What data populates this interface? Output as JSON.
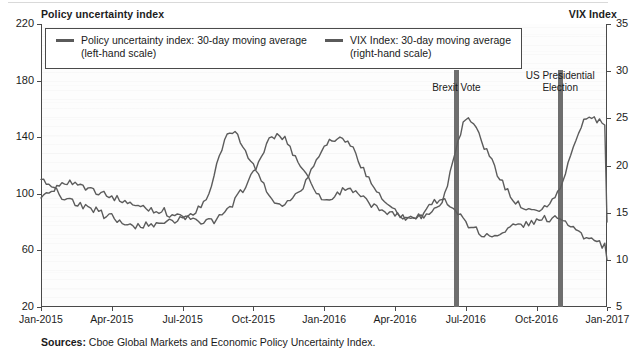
{
  "left_axis_title": "Policy uncertainty index",
  "right_axis_title": "VIX Index",
  "legend": {
    "entries": [
      {
        "label_line1": "Policy uncertainty index: 30-day moving average",
        "label_line2": "(left-hand scale)",
        "color": "#5c5c5c"
      },
      {
        "label_line1": "VIX Index: 30-day moving average",
        "label_line2": "(right-hand scale)",
        "color": "#5c5c5c"
      }
    ]
  },
  "annotations": [
    {
      "name": "brexit-vote",
      "label_line1": "Brexit Vote",
      "label_line2": "",
      "x_value": "Jun-2016"
    },
    {
      "name": "us-presidential-election",
      "label_line1": "US Presidential",
      "label_line2": "Election",
      "x_value": "Nov-2016"
    }
  ],
  "source": {
    "prefix": "Sources:",
    "text": "Cboe Global Markets and Economic Policy Uncertainty Index."
  },
  "chart_data": {
    "type": "line",
    "title": "",
    "xlabel": "",
    "grid": false,
    "legend_position": "top-inside",
    "x_tick_labels": [
      "Jan-2015",
      "Apr-2015",
      "Jul-2015",
      "Oct-2015",
      "Jan-2016",
      "Apr-2016",
      "Jul-2016",
      "Oct-2016",
      "Jan-2017",
      "Apr-2017",
      "Jul-2017",
      "Oct-2017"
    ],
    "x_range": [
      "Jan-2015",
      "Dec-2017"
    ],
    "axes": [
      {
        "id": "left",
        "label": "Policy uncertainty index",
        "ticks": [
          220,
          180,
          140,
          100,
          60,
          20
        ],
        "ylim": [
          20,
          220
        ]
      },
      {
        "id": "right",
        "label": "VIX Index",
        "ticks": [
          35,
          30,
          25,
          20,
          15,
          10,
          5
        ],
        "ylim": [
          5,
          35
        ]
      }
    ],
    "series": [
      {
        "name": "Policy uncertainty index: 30-day moving average",
        "axis": "left",
        "ylabel": "Policy uncertainty index",
        "color": "#5c5c5c",
        "x": [
          "2015-01",
          "2015-02",
          "2015-03",
          "2015-04",
          "2015-05",
          "2015-06",
          "2015-07",
          "2015-08",
          "2015-09",
          "2015-10",
          "2015-11",
          "2015-12",
          "2016-01",
          "2016-02",
          "2016-03",
          "2016-04",
          "2016-05",
          "2016-06",
          "2016-07",
          "2016-08",
          "2016-09",
          "2016-10",
          "2016-11",
          "2016-12",
          "2017-01",
          "2017-02",
          "2017-03",
          "2017-04",
          "2017-05",
          "2017-06",
          "2017-07",
          "2017-08",
          "2017-09",
          "2017-10",
          "2017-11",
          "2017-12"
        ],
        "values": [
          96,
          108,
          104,
          98,
          92,
          88,
          84,
          80,
          90,
          115,
          142,
          120,
          96,
          104,
          92,
          86,
          84,
          96,
          152,
          126,
          96,
          88,
          104,
          152,
          146,
          130,
          152,
          140,
          118,
          106,
          96,
          104,
          90,
          82,
          76,
          80
        ]
      },
      {
        "name": "VIX Index: 30-day moving average",
        "axis": "right",
        "ylabel": "VIX Index",
        "color": "#5c5c5c",
        "x": [
          "2015-01",
          "2015-02",
          "2015-03",
          "2015-04",
          "2015-05",
          "2015-06",
          "2015-07",
          "2015-08",
          "2015-09",
          "2015-10",
          "2015-11",
          "2015-12",
          "2016-01",
          "2016-02",
          "2016-03",
          "2016-04",
          "2016-05",
          "2016-06",
          "2016-07",
          "2016-08",
          "2016-09",
          "2016-10",
          "2016-11",
          "2016-12",
          "2017-01",
          "2017-02",
          "2017-03",
          "2017-04",
          "2017-05",
          "2017-06",
          "2017-07",
          "2017-08",
          "2017-09",
          "2017-10",
          "2017-11",
          "2017-12"
        ],
        "values": [
          18.5,
          16.5,
          15.5,
          14.5,
          13.5,
          14.0,
          14.5,
          16.5,
          23.5,
          20.0,
          16.0,
          17.5,
          22.0,
          22.5,
          18.0,
          15.0,
          14.5,
          16.5,
          14.0,
          12.5,
          13.5,
          14.0,
          14.5,
          12.5,
          11.5,
          11.5,
          11.5,
          12.0,
          11.0,
          10.8,
          10.5,
          11.5,
          10.5,
          10.0,
          10.2,
          10.0
        ]
      }
    ]
  }
}
